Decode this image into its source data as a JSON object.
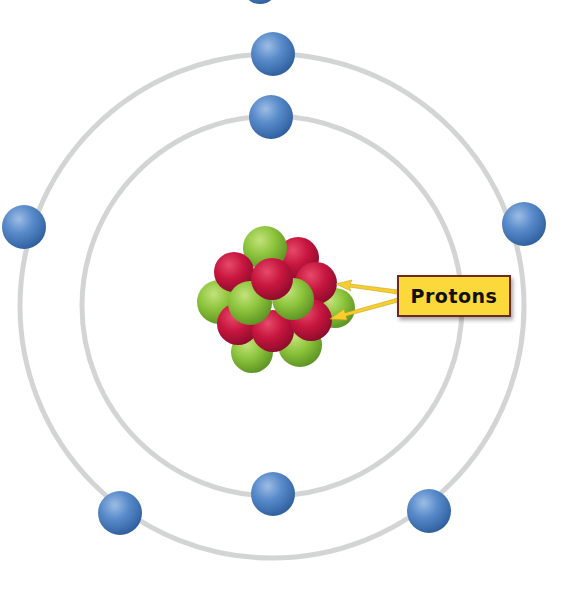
{
  "diagram": {
    "type": "bohr-atom-model",
    "label": "Protons",
    "colors": {
      "background": "#ffffff",
      "orbit": "#d3d5d4",
      "electron": "#4a7fc1",
      "proton": "#c8163f",
      "neutron": "#8cc43c",
      "label_fill": "#fbd93a",
      "label_border": "#6b2a1f",
      "arrow": "#f6cf2e"
    },
    "nucleus": {
      "center": [
        272,
        302
      ],
      "protons": 8,
      "neutrons": 9
    },
    "orbits": [
      {
        "name": "inner",
        "radius": 188,
        "electrons": 2
      },
      {
        "name": "outer",
        "radius": 250,
        "electrons": 5
      }
    ]
  }
}
